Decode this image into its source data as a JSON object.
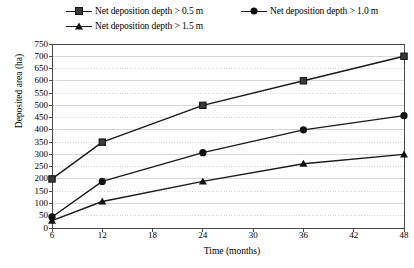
{
  "chart_data": {
    "type": "line",
    "title": "",
    "xlabel": "Time (months)",
    "ylabel": "Deposited area (ha)",
    "x": [
      6,
      12,
      18,
      24,
      30,
      36,
      42,
      48
    ],
    "xlim": [
      6,
      48
    ],
    "ylim": [
      0,
      750
    ],
    "ytick_labels": [
      "0",
      "50",
      "100",
      "150",
      "200",
      "250",
      "300",
      "350",
      "400",
      "450",
      "500",
      "550",
      "600",
      "650",
      "700",
      "750"
    ],
    "ytick_values": [
      0,
      50,
      100,
      150,
      200,
      250,
      300,
      350,
      400,
      450,
      500,
      550,
      600,
      650,
      700,
      750
    ],
    "xtick_labels": [
      "6",
      "12",
      "18",
      "24",
      "30",
      "36",
      "42",
      "48"
    ],
    "grid": true,
    "legend_position": "top",
    "series": [
      {
        "name": "Net deposition depth > 0.5 m",
        "marker": "square",
        "color": "#3a3a3a",
        "x": [
          6,
          12,
          24,
          36,
          48
        ],
        "values": [
          200,
          350,
          500,
          600,
          700
        ]
      },
      {
        "name": "Net deposition depth > 1.0 m",
        "marker": "circle",
        "color": "#111111",
        "x": [
          6,
          12,
          24,
          36,
          48
        ],
        "values": [
          45,
          190,
          307,
          400,
          458
        ]
      },
      {
        "name": "Net deposition depth > 1.5 m",
        "marker": "triangle",
        "color": "#111111",
        "x": [
          6,
          12,
          24,
          36,
          48
        ],
        "values": [
          30,
          108,
          190,
          262,
          300
        ]
      }
    ]
  },
  "legend": {
    "items": [
      {
        "label": "Net deposition depth > 0.5 m",
        "marker": "square"
      },
      {
        "label": "Net deposition depth > 1.0 m",
        "marker": "circle"
      },
      {
        "label": "Net deposition depth > 1.5 m",
        "marker": "triangle"
      }
    ]
  },
  "colors": {
    "axis": "#4a4a4a",
    "grid": "#c8c8c8",
    "line": "#1a1a1a",
    "background": "#ffffff"
  }
}
